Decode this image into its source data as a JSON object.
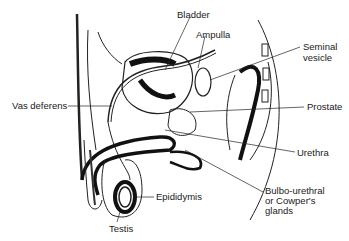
{
  "diagram": {
    "labels": [
      {
        "id": "bladder",
        "text": "Bladder",
        "x": 177,
        "y": 10
      },
      {
        "id": "ampulla",
        "text": "Ampulla",
        "x": 196,
        "y": 30
      },
      {
        "id": "seminal_vesicle_1",
        "text": "Seminal",
        "x": 303,
        "y": 42
      },
      {
        "id": "seminal_vesicle_2",
        "text": "vesicle",
        "x": 303,
        "y": 53
      },
      {
        "id": "vas_deferens",
        "text": "Vas deferens",
        "x": 12,
        "y": 103
      },
      {
        "id": "prostate",
        "text": "Prostate",
        "x": 307,
        "y": 104
      },
      {
        "id": "urethra",
        "text": "Urethra",
        "x": 297,
        "y": 149
      },
      {
        "id": "bulbo_1",
        "text": "Bulbo-urethral",
        "x": 265,
        "y": 188
      },
      {
        "id": "bulbo_2",
        "text": "or Cowper's",
        "x": 265,
        "y": 198
      },
      {
        "id": "bulbo_3",
        "text": "glands",
        "x": 265,
        "y": 208
      },
      {
        "id": "epididymis",
        "text": "Epididymis",
        "x": 156,
        "y": 194
      },
      {
        "id": "testis",
        "text": "Testis",
        "x": 109,
        "y": 226
      }
    ]
  }
}
